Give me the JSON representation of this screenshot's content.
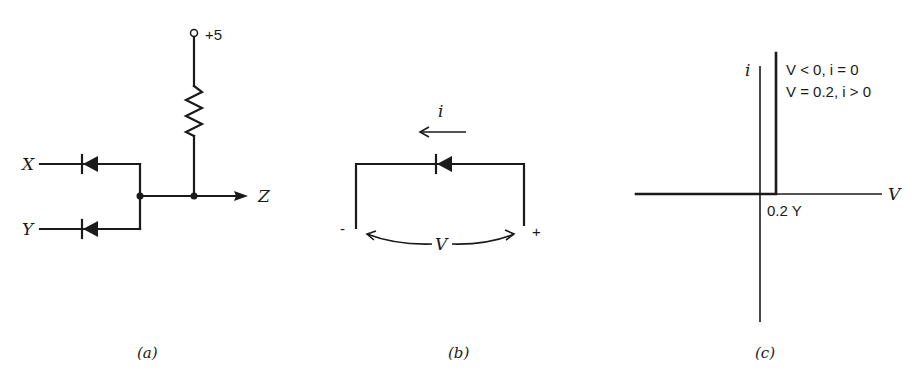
{
  "figure": {
    "panels": [
      {
        "id": "a",
        "caption": "(a)",
        "title": "Diode OR/AND gate circuit",
        "labels": {
          "supply": "+5",
          "input_x": "X",
          "input_y": "Y",
          "output": "Z"
        }
      },
      {
        "id": "b",
        "caption": "(b)",
        "title": "Diode with voltage and current convention",
        "labels": {
          "current": "i",
          "voltage": "V",
          "minus": "-",
          "plus": "+"
        }
      },
      {
        "id": "c",
        "caption": "(c)",
        "title": "Idealized diode I-V characteristic",
        "labels": {
          "y_axis": "i",
          "x_axis": "V",
          "condition_1": "V < 0, i = 0",
          "condition_2": "V = 0.2, i > 0",
          "threshold": "0.2 Y"
        }
      }
    ],
    "colors": {
      "ink": "#1a1a1a",
      "background": "#ffffff"
    }
  }
}
